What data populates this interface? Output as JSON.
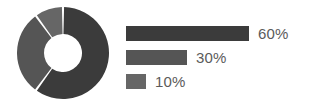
{
  "chart_data": {
    "type": "pie",
    "variant": "donut",
    "title": "",
    "subtitle": "",
    "xlabel": "",
    "ylabel": "",
    "grid": false,
    "legend_position": "right",
    "categories": [
      "60%",
      "30%",
      "10%"
    ],
    "values": [
      60,
      30,
      10
    ],
    "labels": [
      "60%",
      "30%",
      "10%"
    ],
    "units": "percent",
    "total": 100,
    "start_angle_deg": 0,
    "direction": "clockwise",
    "slice_angles_deg": [
      216,
      108,
      36
    ],
    "slice_boundaries_deg": [
      0,
      216,
      324,
      360
    ],
    "colors": [
      "#3b3b3b",
      "#555555",
      "#666666"
    ],
    "separator_color": "#ffffff",
    "separator_width_px": 2,
    "hole_ratio": 0.41,
    "outer_diameter_px": 92,
    "slices": [
      {
        "label": "60%",
        "value": 60,
        "color": "#3b3b3b",
        "angle_deg": 216
      },
      {
        "label": "30%",
        "value": 30,
        "color": "#555555",
        "angle_deg": 108
      },
      {
        "label": "10%",
        "value": 10,
        "color": "#666666",
        "angle_deg": 36
      }
    ]
  },
  "donut": {
    "center_x": 46,
    "center_y": 46,
    "outer_radius": 46,
    "inner_radius": 19
  },
  "legend": {
    "bar_max_width_px": 123,
    "text_color": "#5b5b5b",
    "items": [
      {
        "label": "60%",
        "value": 60,
        "color": "#3b3b3b",
        "bar_width_px": 123
      },
      {
        "label": "30%",
        "value": 30,
        "color": "#555555",
        "bar_width_px": 61
      },
      {
        "label": "10%",
        "value": 10,
        "color": "#666666",
        "bar_width_px": 20
      }
    ]
  }
}
